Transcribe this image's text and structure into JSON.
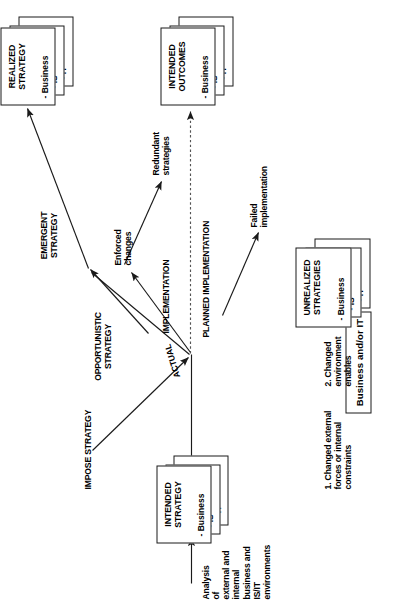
{
  "figure": {
    "header": {
      "label": "Business and/or IT"
    },
    "boxes": {
      "intended_strategy": {
        "title": "INTENDED\nSTRATEGY",
        "items": [
          "- Business",
          "- IS",
          "- IT"
        ]
      },
      "realized_strategy": {
        "title": "REALIZED\nSTRATEGY",
        "items": [
          "- Business",
          "- IS",
          "- IT"
        ]
      },
      "intended_outcomes": {
        "title": "INTENDED\nOUTCOMES",
        "items": [
          "- Business",
          "- IS",
          "- IT"
        ]
      },
      "unrealized_strategies": {
        "title": "UNREALIZED\nSTRATEGIES",
        "items": [
          "- Business",
          "- IS",
          "- IT"
        ]
      }
    },
    "labels": {
      "analysis": "Analysis\nof\nexternal and\ninternal\nbusiness and\nIS/IT\nenvironments",
      "cause_one": "1. Changed external\nforces or internal\nconstraints",
      "cause_two": "2. Changed\nenvironment\nenables",
      "impose_strategy": "IMPOSE STRATEGY",
      "opportunistic_strategy": "OPPORTUNISTIC\nSTRATEGY",
      "emergent_strategy": "EMERGENT\nSTRATEGY",
      "actual_implementation": "ACTUAL  IMPLEMENTATION",
      "actual_word": "ACTUAL",
      "implementation_word": "IMPLEMENTATION",
      "planned_implementation": "PLANNED IMPLEMENTATION",
      "enforced_changes": "Enforced\nchanges",
      "failed_implementation": "Failed\nimplementation",
      "redundant_strategies": "Redundant\nstrategies"
    },
    "colors": {
      "stroke": "#1a1a1a",
      "text": "#000000",
      "background": "#ffffff",
      "dashed_stroke": "#555555"
    }
  }
}
